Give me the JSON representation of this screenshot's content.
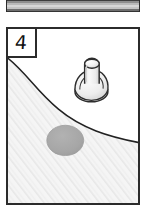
{
  "figure": {
    "panel_label": "4",
    "panel_label_name": "panel-number-4",
    "caption": ""
  },
  "previous_figure_strip": {
    "name": "cropped-bar-above",
    "description": "striped gray bar",
    "visible": true
  },
  "scene": {
    "background_region_label": "white-upper-region",
    "textured_region_label": "hatched-lower-region",
    "boundary_label": "s-curve-boundary",
    "objects": [
      {
        "name": "mushroom-valve-object",
        "label": "",
        "x_pct": 64,
        "y_pct": 34
      },
      {
        "name": "gray-blob-spot",
        "label": "",
        "x_pct": 44,
        "y_pct": 64
      }
    ]
  },
  "colors": {
    "outline": "#2b2b2b",
    "panel_fill": "#ffffff",
    "hatch_fill": "#f4f4f4",
    "hatch_line": "#e3e3e3",
    "blob_fill": "#a8a8a8",
    "blob_stroke": "#9a9a9a",
    "object_light": "#fbfbfb",
    "object_mid": "#e6e6e6",
    "object_shade": "#cfcfcf",
    "strip_dark": "#3d3d3d",
    "strip_light": "#d6d6d6"
  }
}
